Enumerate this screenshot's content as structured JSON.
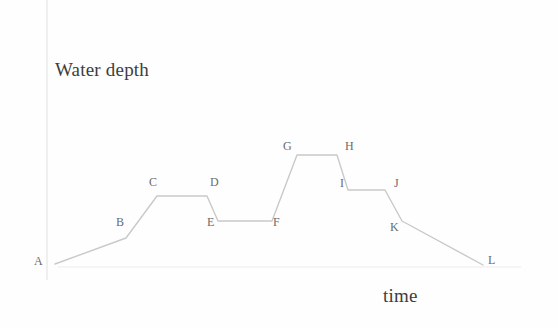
{
  "figure": {
    "y_axis_title": "Water depth",
    "x_axis_title": "time"
  },
  "chart_data": {
    "type": "line",
    "title": "",
    "subtitle": "",
    "xlabel": "time",
    "ylabel": "Water depth",
    "xlim": [
      0,
      559
    ],
    "ylim": [
      0,
      329
    ],
    "grid": false,
    "legend": null,
    "axes": {
      "y_axis_x": 47,
      "y_axis_top": 0,
      "y_axis_bottom": 280,
      "x_axis_y": 267,
      "x_axis_left": 58,
      "x_axis_right": 521,
      "axis_color": "#e2e2e2"
    },
    "line_color": "#c9c9c9",
    "line_width": 1.4,
    "annotations": [
      "A",
      "B",
      "C",
      "D",
      "E",
      "F",
      "G",
      "H",
      "I",
      "J",
      "K",
      "L"
    ],
    "points": [
      {
        "name": "A",
        "x": 55,
        "y": 264,
        "label_x": 34,
        "label_y": 255,
        "depth": 0.0,
        "time": 0.0
      },
      {
        "name": "B",
        "x": 126,
        "y": 238,
        "label_x": 116,
        "label_y": 216,
        "depth": 0.26,
        "time": 1.0
      },
      {
        "name": "C",
        "x": 157,
        "y": 196,
        "label_x": 149,
        "label_y": 176,
        "depth": 0.68,
        "time": 1.5
      },
      {
        "name": "D",
        "x": 207,
        "y": 196,
        "label_x": 210,
        "label_y": 176,
        "depth": 0.68,
        "time": 2.2
      },
      {
        "name": "E",
        "x": 218,
        "y": 221,
        "label_x": 207,
        "label_y": 216,
        "depth": 0.43,
        "time": 2.4
      },
      {
        "name": "F",
        "x": 272,
        "y": 221,
        "label_x": 273,
        "label_y": 216,
        "depth": 0.43,
        "time": 3.2
      },
      {
        "name": "G",
        "x": 297,
        "y": 155,
        "label_x": 283,
        "label_y": 140,
        "depth": 1.09,
        "time": 3.6
      },
      {
        "name": "H",
        "x": 337,
        "y": 155,
        "label_x": 345,
        "label_y": 140,
        "depth": 1.09,
        "time": 4.2
      },
      {
        "name": "I",
        "x": 348,
        "y": 190,
        "label_x": 340,
        "label_y": 177,
        "depth": 0.74,
        "time": 4.4
      },
      {
        "name": "J",
        "x": 385,
        "y": 190,
        "label_x": 394,
        "label_y": 177,
        "depth": 0.74,
        "time": 5.0
      },
      {
        "name": "K",
        "x": 402,
        "y": 221,
        "label_x": 390,
        "label_y": 221,
        "depth": 0.43,
        "time": 5.3
      },
      {
        "name": "L",
        "x": 483,
        "y": 265,
        "label_x": 488,
        "label_y": 254,
        "depth": 0.0,
        "time": 6.5
      }
    ],
    "polyline": "55,264 126,238 157,196 207,196 218,221 272,221 297,155 337,155 348,190 385,190 402,221 483,265"
  }
}
